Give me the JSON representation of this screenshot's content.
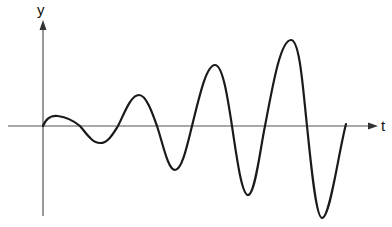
{
  "diagram": {
    "type": "oscillation-growing-amplitude",
    "axes": {
      "vertical_label": "y",
      "horizontal_label": "t"
    },
    "colors": {
      "axis": "#555555",
      "curve": "#1a1a1a",
      "background": "#ffffff"
    },
    "curve_description": "Oscillating waveform with increasing amplitude over time, starting at the origin"
  }
}
